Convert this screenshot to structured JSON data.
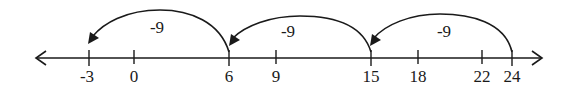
{
  "diagram": {
    "type": "number-line",
    "ticks": [
      {
        "value": "-3",
        "x": 89
      },
      {
        "value": "0",
        "x": 134
      },
      {
        "value": "6",
        "x": 229
      },
      {
        "value": "9",
        "x": 276
      },
      {
        "value": "15",
        "x": 371
      },
      {
        "value": "18",
        "x": 418
      },
      {
        "value": "22",
        "x": 482
      },
      {
        "value": "24",
        "x": 512
      }
    ],
    "jumps": [
      {
        "from": "24",
        "to": "15",
        "label": "-9"
      },
      {
        "from": "15",
        "to": "6",
        "label": "-9"
      },
      {
        "from": "6",
        "to": "-3",
        "label": "-9"
      }
    ]
  }
}
